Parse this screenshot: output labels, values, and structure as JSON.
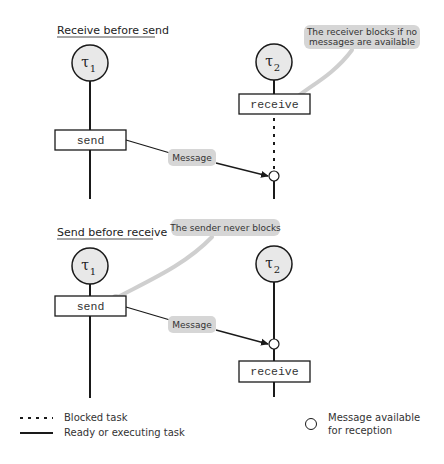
{
  "colors": {
    "line": "#1a1a1a",
    "task_fill": "#e8e8e8",
    "callout_fill": "#d6d6d6",
    "callout_leader": "#cfcfcf",
    "box_fill": "#ffffff"
  },
  "scenario_receive_first": {
    "title": "Receive before send",
    "task1": {
      "symbol": "τ",
      "index": "1",
      "operation": "send"
    },
    "task2": {
      "symbol": "τ",
      "index": "2",
      "operation": "receive"
    },
    "message_label": "Message",
    "callout": {
      "line1": "The receiver blocks if no",
      "line2": "messages are available"
    }
  },
  "scenario_send_first": {
    "title": "Send before receive",
    "task1": {
      "symbol": "τ",
      "index": "1",
      "operation": "send"
    },
    "task2": {
      "symbol": "τ",
      "index": "2",
      "operation": "receive"
    },
    "message_label": "Message",
    "callout": {
      "line1": "The sender never blocks"
    }
  },
  "legend": {
    "blocked": "Blocked task",
    "ready": "Ready or executing task",
    "message_available_line1": "Message available",
    "message_available_line2": "for reception"
  }
}
